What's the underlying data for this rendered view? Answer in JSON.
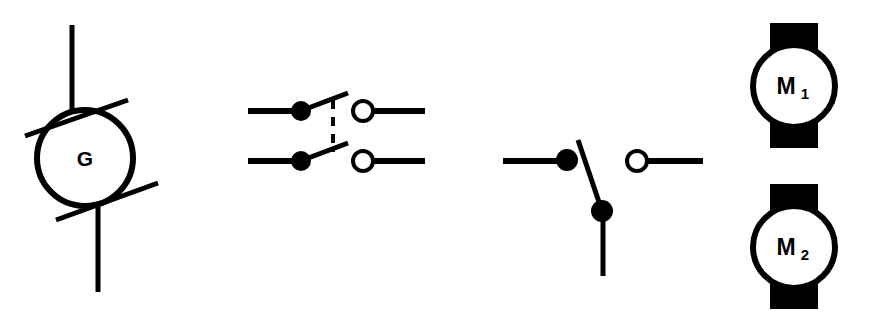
{
  "diagram": {
    "background_color": "#ffffff",
    "stroke_color": "#000000",
    "width": 873,
    "height": 321,
    "symbols": [
      {
        "id": "generator",
        "name": "generator-symbol",
        "label": "G",
        "description": "DC generator symbol: circle with vertical leads top and bottom and two diagonal brush slashes"
      },
      {
        "id": "double-pole-switch",
        "name": "double-pole-switch-symbol",
        "label": "",
        "description": "Two-pole switch, both blades open, joined by a dashed mechanical coupling line"
      },
      {
        "id": "single-pole-switch",
        "name": "single-pole-switch-symbol",
        "label": "",
        "description": "Single-pole changeover switch shown in open position with blade swung down"
      },
      {
        "id": "motor-1",
        "name": "motor-1-symbol",
        "label_main": "M",
        "label_sub": "1",
        "description": "Motor symbol: circle with solid terminal bars at top and bottom"
      },
      {
        "id": "motor-2",
        "name": "motor-2-symbol",
        "label_main": "M",
        "label_sub": "2",
        "description": "Motor symbol: circle with solid terminal bars at top and bottom"
      }
    ]
  }
}
